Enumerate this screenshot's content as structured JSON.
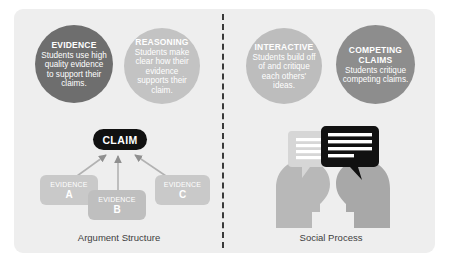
{
  "figure": {
    "background_color": "#ffffff",
    "panel_color": "#eeeeee",
    "divider_color": "#3a3a3a"
  },
  "circles": [
    {
      "name": "evidence",
      "title": "EVIDENCE",
      "body": "Students use high quality evidence to support their claims.",
      "color": "#6e6e6e"
    },
    {
      "name": "reasoning",
      "title": "REASONING",
      "body": "Students make clear how their evidence supports their claim.",
      "color": "#c3c3c3"
    },
    {
      "name": "interactive",
      "title": "INTERACTIVE",
      "body": "Students build off of and critique each others' ideas.",
      "color": "#bdbdbd"
    },
    {
      "name": "competing-claims",
      "title": "COMPETING CLAIMS",
      "body": "Students critique competing claims.",
      "color": "#8d8d8d"
    }
  ],
  "argument_structure": {
    "claim_label": "CLAIM",
    "claim_color": "#111111",
    "evidence_nodes": [
      {
        "label": "EVIDENCE",
        "letter": "A",
        "color": "#c9c9c9"
      },
      {
        "label": "EVIDENCE",
        "letter": "B",
        "color": "#bfbfbf"
      },
      {
        "label": "EVIDENCE",
        "letter": "C",
        "color": "#c9c9c9"
      }
    ]
  },
  "social_process": {
    "head_left_color": "#b8b8b8",
    "head_right_color": "#a8a8a8",
    "bubble_light_color": "#d6d6d6",
    "bubble_dark_color": "#111111"
  },
  "captions": {
    "left": "Argument Structure",
    "right": "Social Process"
  }
}
